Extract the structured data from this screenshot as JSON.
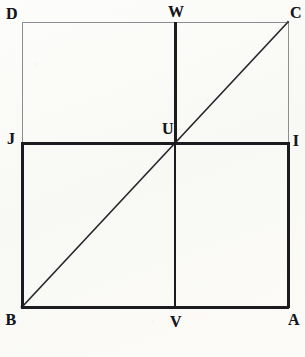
{
  "figure": {
    "width": 305,
    "height": 357,
    "background_color": "#fbfbf9",
    "ink_color": "#15151a",
    "faint_line_color": "#8e8e92"
  },
  "geometry": {
    "outer_rectangle": {
      "name": "DCAB",
      "left": 22,
      "top": 22,
      "right": 288,
      "bottom": 307
    },
    "inner_rectangle": {
      "name": "JIAB",
      "left": 22,
      "top": 143,
      "right": 288,
      "bottom": 307
    },
    "midline_vertical": {
      "name": "WV",
      "x": 175,
      "y1": 22,
      "y2": 307
    },
    "midline_horizontal": {
      "name": "JI",
      "y": 143,
      "x1": 22,
      "x2": 288
    },
    "diagonal": {
      "name": "BC",
      "x1": 22,
      "y1": 307,
      "x2": 288,
      "y2": 22
    },
    "center_point": {
      "name": "U",
      "x": 175,
      "y": 143
    }
  },
  "strokes": {
    "thin_width": 1,
    "medium_width": 2,
    "thick_width": 3
  },
  "labels": [
    {
      "id": "D",
      "text": "D",
      "x": 12,
      "y": 14
    },
    {
      "id": "W",
      "text": "W",
      "x": 176,
      "y": 12
    },
    {
      "id": "C",
      "text": "C",
      "x": 296,
      "y": 13
    },
    {
      "id": "J",
      "text": "J",
      "x": 11,
      "y": 139
    },
    {
      "id": "U",
      "text": "U",
      "x": 168,
      "y": 129
    },
    {
      "id": "I",
      "text": "I",
      "x": 296,
      "y": 141
    },
    {
      "id": "B",
      "text": "B",
      "x": 11,
      "y": 320
    },
    {
      "id": "V",
      "text": "V",
      "x": 176,
      "y": 322
    },
    {
      "id": "A",
      "text": "A",
      "x": 294,
      "y": 320
    }
  ]
}
